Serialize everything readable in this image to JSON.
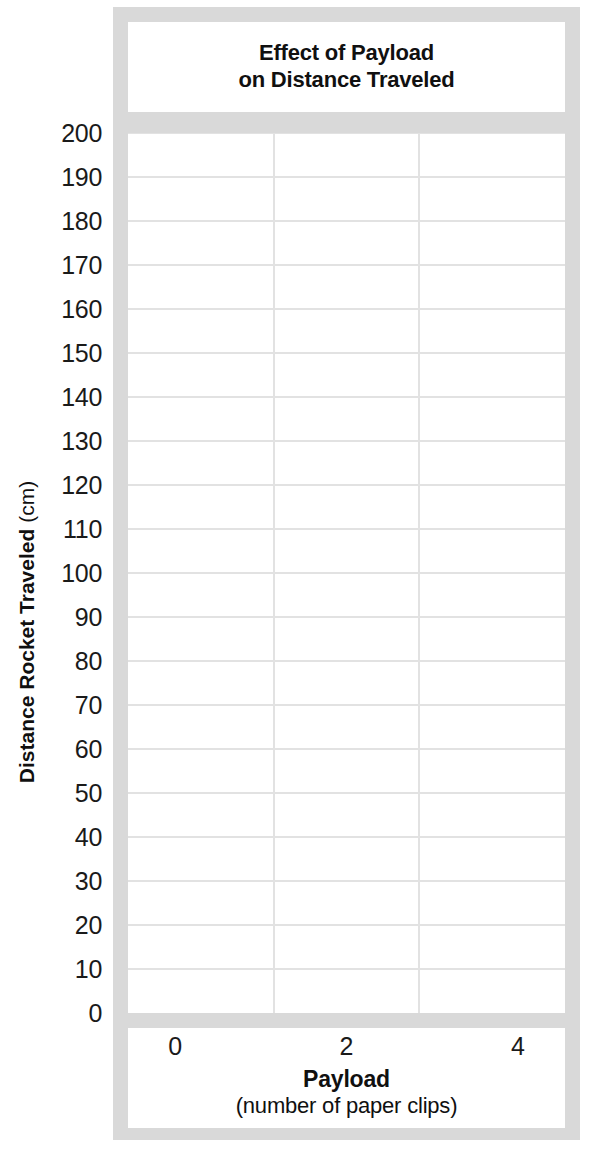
{
  "chart_data": {
    "type": "line",
    "title": "Effect of Payload on Distance Traveled",
    "title_line1": "Effect of Payload",
    "title_line2": "on Distance Traveled",
    "xlabel": "Payload",
    "xlabel_unit": "(number of paper clips)",
    "ylabel": "Distance Rocket Traveled",
    "ylabel_unit": "(cm)",
    "xlim": [
      -0.55,
      4.55
    ],
    "ylim": [
      0,
      200
    ],
    "x_ticks": [
      0,
      2,
      4
    ],
    "x_tick_labels": [
      "0",
      "2",
      "4"
    ],
    "y_ticks": [
      0,
      10,
      20,
      30,
      40,
      50,
      60,
      70,
      80,
      90,
      100,
      110,
      120,
      130,
      140,
      150,
      160,
      170,
      180,
      190,
      200
    ],
    "y_tick_labels": [
      "0",
      "10",
      "20",
      "30",
      "40",
      "50",
      "60",
      "70",
      "80",
      "90",
      "100",
      "110",
      "120",
      "130",
      "140",
      "150",
      "160",
      "170",
      "180",
      "190",
      "200"
    ],
    "series": [],
    "values": [],
    "categories": [],
    "grid": true,
    "grid_horizontal": true,
    "grid_vertical": true,
    "legend": false,
    "note": "Empty blank grid worksheet - no data plotted"
  },
  "colors": {
    "frame": "#d9d9d9",
    "plot_background": "#ffffff",
    "gridline": "#e2e2e2",
    "text": "#101010",
    "tick_text": "#1a1a1a"
  },
  "layout": {
    "vertical_gridline_fractions": [
      0.3341,
      0.6659
    ],
    "horizontal_gridline_count": 20
  }
}
